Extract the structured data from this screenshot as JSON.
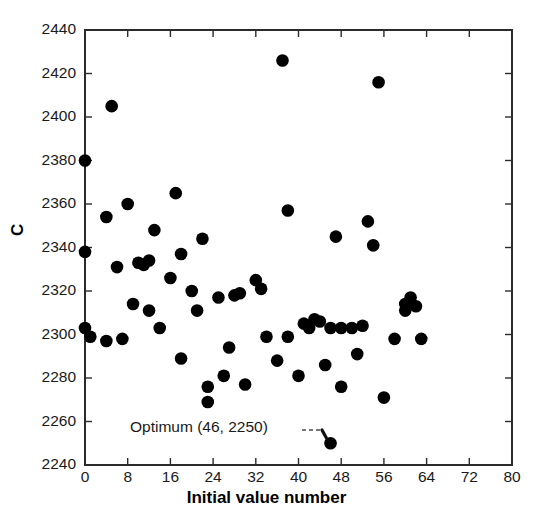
{
  "chart_data": {
    "type": "scatter",
    "title": "",
    "xlabel": "Initial value number",
    "ylabel": "C",
    "xlim": [
      0,
      80
    ],
    "ylim": [
      2240,
      2440
    ],
    "xticks": [
      0,
      8,
      16,
      24,
      32,
      40,
      48,
      56,
      64,
      72,
      80
    ],
    "yticks": [
      2240,
      2260,
      2280,
      2300,
      2320,
      2340,
      2360,
      2380,
      2400,
      2420,
      2440
    ],
    "grid": false,
    "legend": null,
    "marker": {
      "shape": "circle",
      "color": "#000000",
      "size": 9
    },
    "annotations": [
      {
        "text": "Optimum (46, 2250)",
        "x": 46,
        "y": 2250,
        "leader": "dashed"
      }
    ],
    "points": [
      {
        "x": 0,
        "y": 2380
      },
      {
        "x": 0,
        "y": 2338
      },
      {
        "x": 0,
        "y": 2303
      },
      {
        "x": 1,
        "y": 2299
      },
      {
        "x": 4,
        "y": 2297
      },
      {
        "x": 5,
        "y": 2405
      },
      {
        "x": 4,
        "y": 2354
      },
      {
        "x": 6,
        "y": 2331
      },
      {
        "x": 7,
        "y": 2298
      },
      {
        "x": 8,
        "y": 2360
      },
      {
        "x": 9,
        "y": 2314
      },
      {
        "x": 10,
        "y": 2333
      },
      {
        "x": 11,
        "y": 2332
      },
      {
        "x": 12,
        "y": 2334
      },
      {
        "x": 12,
        "y": 2311
      },
      {
        "x": 13,
        "y": 2348
      },
      {
        "x": 14,
        "y": 2303
      },
      {
        "x": 16,
        "y": 2326
      },
      {
        "x": 17,
        "y": 2365
      },
      {
        "x": 18,
        "y": 2337
      },
      {
        "x": 18,
        "y": 2289
      },
      {
        "x": 20,
        "y": 2320
      },
      {
        "x": 21,
        "y": 2311
      },
      {
        "x": 22,
        "y": 2344
      },
      {
        "x": 23,
        "y": 2276
      },
      {
        "x": 23,
        "y": 2269
      },
      {
        "x": 25,
        "y": 2317
      },
      {
        "x": 26,
        "y": 2281
      },
      {
        "x": 27,
        "y": 2294
      },
      {
        "x": 28,
        "y": 2318
      },
      {
        "x": 29,
        "y": 2319
      },
      {
        "x": 30,
        "y": 2277
      },
      {
        "x": 32,
        "y": 2325
      },
      {
        "x": 33,
        "y": 2321
      },
      {
        "x": 34,
        "y": 2299
      },
      {
        "x": 36,
        "y": 2288
      },
      {
        "x": 37,
        "y": 2426
      },
      {
        "x": 38,
        "y": 2357
      },
      {
        "x": 38,
        "y": 2299
      },
      {
        "x": 40,
        "y": 2281
      },
      {
        "x": 41,
        "y": 2305
      },
      {
        "x": 42,
        "y": 2303
      },
      {
        "x": 43,
        "y": 2307
      },
      {
        "x": 44,
        "y": 2306
      },
      {
        "x": 45,
        "y": 2286
      },
      {
        "x": 46,
        "y": 2250
      },
      {
        "x": 46,
        "y": 2303
      },
      {
        "x": 47,
        "y": 2345
      },
      {
        "x": 48,
        "y": 2303
      },
      {
        "x": 48,
        "y": 2276
      },
      {
        "x": 50,
        "y": 2303
      },
      {
        "x": 51,
        "y": 2291
      },
      {
        "x": 52,
        "y": 2304
      },
      {
        "x": 53,
        "y": 2352
      },
      {
        "x": 54,
        "y": 2341
      },
      {
        "x": 55,
        "y": 2416
      },
      {
        "x": 56,
        "y": 2271
      },
      {
        "x": 58,
        "y": 2298
      },
      {
        "x": 60,
        "y": 2314
      },
      {
        "x": 60,
        "y": 2311
      },
      {
        "x": 61,
        "y": 2317
      },
      {
        "x": 62,
        "y": 2313
      },
      {
        "x": 63,
        "y": 2298
      }
    ]
  }
}
